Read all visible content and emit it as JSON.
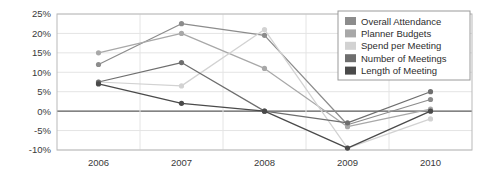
{
  "chart_data": {
    "type": "line",
    "title": "",
    "xlabel": "",
    "ylabel": "",
    "categories": [
      "2006",
      "2007",
      "2008",
      "2009",
      "2010"
    ],
    "ylim": [
      -10,
      25
    ],
    "yticks": [
      25,
      20,
      15,
      10,
      5,
      0,
      -5,
      -10
    ],
    "ytick_labels": [
      "25%",
      "20%",
      "15%",
      "10%",
      "5%",
      "0%",
      "-5%",
      "-10%"
    ],
    "grid": true,
    "legend_position": "top-right",
    "series": [
      {
        "name": "Overall Attendance",
        "color": "#8c8c8c",
        "values": [
          12,
          22.5,
          19.5,
          -3.5,
          3
        ]
      },
      {
        "name": "Planner Budgets",
        "color": "#a8a8a8",
        "values": [
          15,
          20,
          11,
          -4,
          0.5
        ]
      },
      {
        "name": "Spend per Meeting",
        "color": "#d2d2d2",
        "values": [
          7.5,
          6.5,
          21,
          -9.5,
          -2
        ]
      },
      {
        "name": "Number of Meetings",
        "color": "#6e6e6e",
        "values": [
          7.5,
          12.5,
          0,
          -3,
          5
        ]
      },
      {
        "name": "Length of Meeting",
        "color": "#4a4a4a",
        "values": [
          7,
          2,
          0,
          -9.5,
          0
        ]
      }
    ]
  },
  "legend": {
    "items": [
      {
        "label": "Overall Attendance"
      },
      {
        "label": "Planner Budgets"
      },
      {
        "label": "Spend per Meeting"
      },
      {
        "label": "Number of Meetings"
      },
      {
        "label": "Length of Meeting"
      }
    ]
  }
}
